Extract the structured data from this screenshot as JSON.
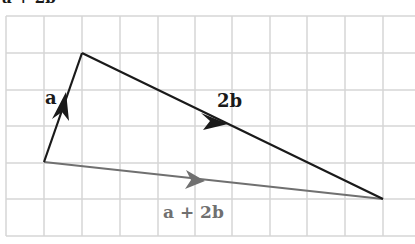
{
  "title": "a + 2b",
  "grid": {
    "color": "#d6d6d6",
    "x_lines": [
      6,
      44,
      82,
      120,
      158,
      195,
      232,
      270,
      307,
      345,
      383
    ],
    "y_lines": [
      16,
      53,
      90,
      126,
      163,
      199,
      236
    ],
    "left": 6,
    "right": 415,
    "top": 16,
    "bottom": 236
  },
  "points": {
    "origin": [
      44,
      162
    ],
    "tip_a": [
      82,
      53
    ],
    "tip_2b": [
      383,
      199
    ]
  },
  "vectors": [
    {
      "name": "a",
      "label": "a",
      "color": "#1a1a1a",
      "from": "origin",
      "to": "tip_a"
    },
    {
      "name": "2b",
      "label": "2b",
      "color": "#1a1a1a",
      "from": "tip_a",
      "to": "tip_2b"
    },
    {
      "name": "a+2b",
      "label": "a + 2b",
      "color": "#707070",
      "from": "origin",
      "to": "tip_2b"
    }
  ],
  "labels": {
    "a": "a",
    "two_b": "2b",
    "sum": "a + 2b"
  },
  "colors": {
    "dark": "#1a1a1a",
    "gray": "#707070",
    "grid": "#d6d6d6"
  }
}
